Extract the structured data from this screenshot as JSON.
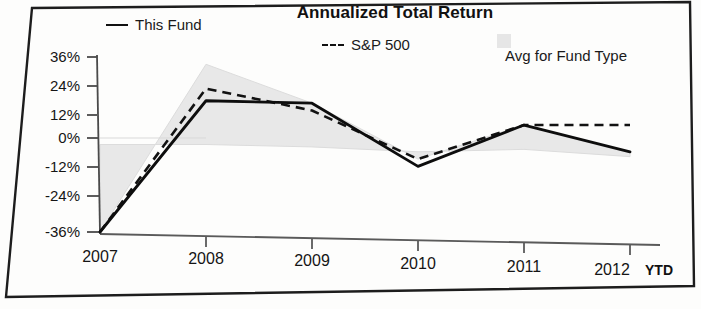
{
  "chart_data": {
    "type": "line",
    "title": "Annualized Total Return",
    "xlabel": "",
    "ylabel": "",
    "x": [
      "2007",
      "2008",
      "2009",
      "2010",
      "2011",
      "2012 YTD"
    ],
    "categories": [
      "2007",
      "2008",
      "2009",
      "2010",
      "2011",
      "2012 YTD"
    ],
    "xtick_labels": [
      "2007",
      "2008",
      "2009",
      "2010",
      "2011",
      "2012"
    ],
    "xtick_suffix": "YTD",
    "ytick_labels": [
      "36%",
      "24%",
      "12%",
      "0%",
      "-12%",
      "-24%",
      "-36%"
    ],
    "ytick_values": [
      36,
      24,
      12,
      0,
      -12,
      -24,
      -36
    ],
    "ylim": [
      -36,
      36
    ],
    "grid": false,
    "legend_position": "top",
    "series": [
      {
        "name": "This Fund",
        "style": "solid",
        "color": "#111111",
        "values": [
          -36,
          18,
          17,
          -9,
          8,
          -3
        ]
      },
      {
        "name": "S&P 500",
        "style": "dashed",
        "color": "#111111",
        "values": [
          -36,
          23,
          14,
          -6,
          8,
          8
        ]
      },
      {
        "name": "Avg for Fund Type",
        "style": "band",
        "color": "#e6e6e6",
        "band_upper": [
          -36,
          33,
          17,
          -6,
          8,
          -3
        ],
        "band_lower": [
          0,
          0,
          -1,
          -3,
          -2,
          -5
        ]
      }
    ]
  },
  "title": "Annualized Total Return",
  "legend": {
    "this_fund": "This Fund",
    "sp500": "S&P 500",
    "avg_fund_type": "Avg for Fund Type"
  },
  "yaxis": {
    "t0": "36%",
    "t1": "24%",
    "t2": "12%",
    "t3": "0%",
    "t4": "-12%",
    "t5": "-24%",
    "t6": "-36%"
  },
  "xaxis": {
    "t0": "2007",
    "t1": "2008",
    "t2": "2009",
    "t3": "2010",
    "t4": "2011",
    "t5": "2012",
    "ytd": "YTD"
  }
}
